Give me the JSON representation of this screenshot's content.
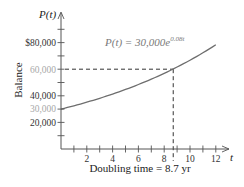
{
  "chart_data": {
    "type": "line",
    "title": "",
    "function": "P(t) = 30,000e^{0.08t}",
    "formula_label": {
      "lhs": "P(t) = 30,000",
      "base": "e",
      "exponent": "0.08t"
    },
    "xlabel": "t",
    "ylabel_top": "P(t)",
    "ylabel_side": "Balance",
    "caption": "Doubling time = 8.7 yr",
    "xlim": [
      0,
      13
    ],
    "ylim": [
      0,
      95000
    ],
    "x_ticks": [
      1,
      2,
      3,
      4,
      5,
      6,
      7,
      8,
      9,
      10,
      11,
      12
    ],
    "x_tick_labels": [
      {
        "value": 2,
        "label": "2"
      },
      {
        "value": 4,
        "label": "4"
      },
      {
        "value": 6,
        "label": "6"
      },
      {
        "value": 8,
        "label": "8"
      },
      {
        "value": 10,
        "label": "10"
      },
      {
        "value": 12,
        "label": "12"
      }
    ],
    "y_ticks": [
      10000,
      20000,
      30000,
      40000,
      50000,
      60000,
      70000,
      80000,
      90000
    ],
    "y_tick_labels": [
      {
        "value": 80000,
        "label": "$80,000",
        "muted": false
      },
      {
        "value": 60000,
        "label": "60,000",
        "muted": true
      },
      {
        "value": 40000,
        "label": "40,000",
        "muted": false
      },
      {
        "value": 30000,
        "label": "30,000",
        "muted": true
      },
      {
        "value": 20000,
        "label": "20,000",
        "muted": false
      }
    ],
    "series": [
      {
        "name": "P(t)",
        "x": [
          0,
          1,
          2,
          3,
          4,
          5,
          6,
          7,
          8,
          9,
          10,
          11,
          12
        ],
        "values": [
          30000,
          32498,
          35204,
          38135,
          41311,
          44755,
          48483,
          52521,
          56896,
          61634,
          66766,
          72327,
          78351
        ],
        "color": "#6e6e6e"
      }
    ],
    "annotations": [
      {
        "type": "dashed-hline",
        "y": 60000,
        "x_from": 0,
        "x_to": 8.7
      },
      {
        "type": "dashed-vline",
        "x": 8.7,
        "y_from": 0,
        "y_to": 60000
      },
      {
        "type": "point",
        "x": 8.7,
        "y": 60000
      }
    ],
    "grid": false,
    "legend": "none",
    "colors": {
      "axis": "#555555",
      "curve": "#6e6e6e",
      "dash": "#333333",
      "muted_label": "#a8a8a8"
    }
  }
}
